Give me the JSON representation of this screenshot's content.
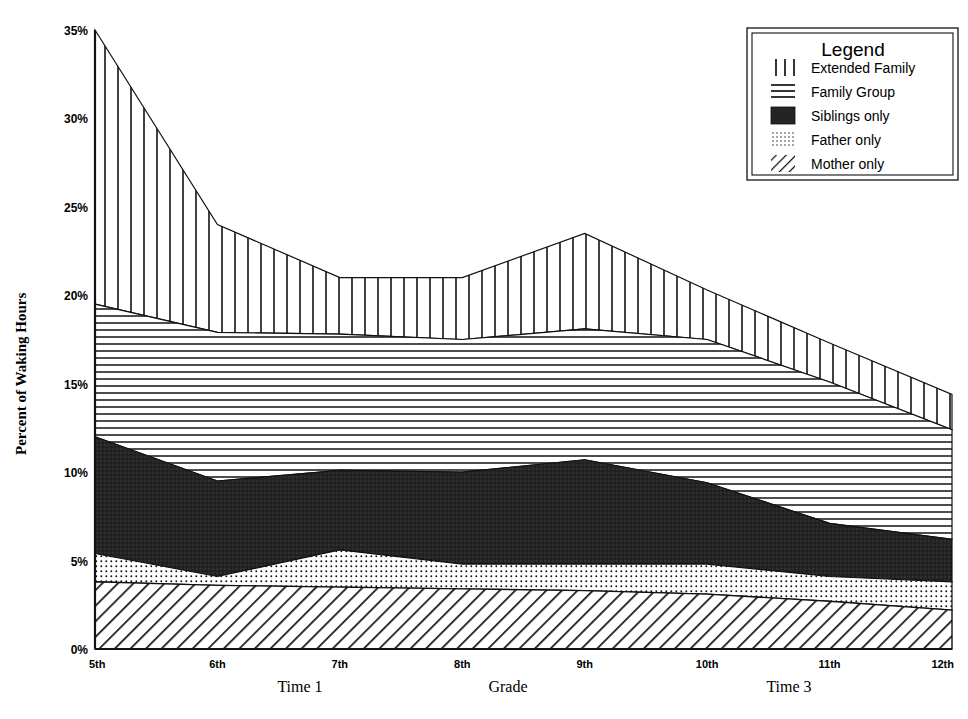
{
  "chart_data": {
    "type": "area",
    "title": "",
    "xlabel": "Grade",
    "ylabel": "Percent of Waking Hours",
    "categories": [
      "5th",
      "6th",
      "7th",
      "8th",
      "9th",
      "10th",
      "11th",
      "12th"
    ],
    "x": [
      5,
      6,
      7,
      8,
      9,
      10,
      11,
      12
    ],
    "ylim": [
      0,
      35
    ],
    "yticks": [
      0,
      5,
      10,
      15,
      20,
      25,
      30,
      35
    ],
    "ytick_labels": [
      "0%",
      "5%",
      "10%",
      "15%",
      "20%",
      "25%",
      "30%",
      "35%"
    ],
    "xtick_labels": [
      "5th",
      "6th",
      "7th",
      "8th",
      "9th",
      "10th",
      "11th",
      "12th"
    ],
    "grid": false,
    "stacked": true,
    "legend_position": "top-right",
    "legend_title": "Legend",
    "time_labels": [
      {
        "text": "Time 1",
        "x_grade": 6.6
      },
      {
        "text": "Time 3",
        "x_grade": 10.6
      }
    ],
    "series": [
      {
        "name": "Mother only",
        "pattern": "diagonal-hatch",
        "values": [
          3.8,
          3.6,
          3.5,
          3.4,
          3.3,
          3.1,
          2.7,
          2.2
        ]
      },
      {
        "name": "Father only",
        "pattern": "dots",
        "values": [
          1.6,
          0.5,
          2.1,
          1.4,
          1.5,
          1.7,
          1.4,
          1.6
        ]
      },
      {
        "name": "Siblings only",
        "pattern": "solid-dark",
        "values": [
          6.6,
          5.4,
          4.5,
          5.2,
          5.9,
          4.6,
          3.0,
          2.4
        ]
      },
      {
        "name": "Family Group",
        "pattern": "horizontal-lines",
        "values": [
          7.5,
          8.4,
          7.7,
          7.5,
          7.4,
          8.1,
          8.0,
          6.2
        ]
      },
      {
        "name": "Extended Family",
        "pattern": "vertical-lines",
        "values": [
          15.5,
          6.1,
          3.2,
          3.5,
          5.4,
          2.8,
          2.2,
          2.0
        ]
      }
    ],
    "cumulative_tops": {
      "mother_only": [
        3.8,
        3.6,
        3.5,
        3.4,
        3.3,
        3.1,
        2.7,
        2.2
      ],
      "father_only": [
        5.4,
        4.1,
        5.6,
        4.8,
        4.8,
        4.8,
        4.1,
        3.8
      ],
      "siblings_only": [
        12.0,
        9.5,
        10.1,
        10.0,
        10.7,
        9.4,
        7.1,
        6.2
      ],
      "family_group": [
        19.5,
        17.9,
        17.8,
        17.5,
        18.1,
        17.5,
        15.1,
        12.4
      ],
      "extended_family": [
        35.0,
        24.0,
        21.0,
        21.0,
        23.5,
        20.3,
        17.3,
        14.4
      ]
    }
  },
  "legend": {
    "title": "Legend",
    "items": [
      {
        "label": "Extended Family",
        "swatch": "vertical-lines"
      },
      {
        "label": "Family Group",
        "swatch": "horizontal-lines"
      },
      {
        "label": "Siblings only",
        "swatch": "solid-dark"
      },
      {
        "label": "Father only",
        "swatch": "dots"
      },
      {
        "label": "Mother only",
        "swatch": "diagonal-hatch"
      }
    ]
  },
  "axes": {
    "y_title": "Percent of Waking Hours",
    "x_title": "Grade",
    "y_ticks": [
      "35%",
      "30%",
      "25%",
      "20%",
      "15%",
      "10%",
      "5%",
      "0%"
    ],
    "x_ticks": [
      "5th",
      "6th",
      "7th",
      "8th",
      "9th",
      "10th",
      "11th",
      "12th"
    ]
  },
  "annotations": {
    "time1": "Time 1",
    "time3": "Time 3"
  },
  "colors": {
    "ink": "#111111",
    "paper": "#ffffff",
    "dark_fill": "#242424"
  }
}
